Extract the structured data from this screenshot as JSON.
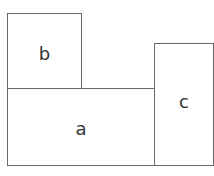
{
  "diagram": {
    "boxes": [
      {
        "id": "a",
        "label": "a",
        "x": 7,
        "y": 89,
        "w": 148,
        "h": 77
      },
      {
        "id": "b",
        "label": "b",
        "x": 7,
        "y": 13,
        "w": 75,
        "h": 77
      },
      {
        "id": "c",
        "label": "c",
        "x": 154,
        "y": 43,
        "w": 60,
        "h": 123
      }
    ],
    "border_color": "#6a6a6a"
  }
}
